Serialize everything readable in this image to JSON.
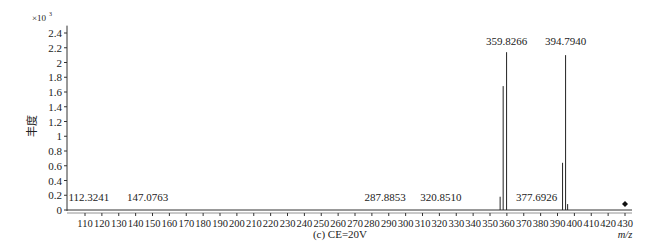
{
  "chart_data": {
    "type": "bar",
    "subtype": "mass-spectrum-stick",
    "title": "(c) CE=20V",
    "xlabel": "m/z",
    "ylabel": "丰度",
    "y_multiplier": "×10³",
    "xlim": [
      100,
      435
    ],
    "ylim": [
      0,
      2.5
    ],
    "x_ticks": [
      110,
      120,
      130,
      140,
      150,
      160,
      170,
      180,
      190,
      200,
      210,
      220,
      230,
      240,
      250,
      260,
      270,
      280,
      290,
      300,
      310,
      320,
      330,
      340,
      350,
      360,
      370,
      380,
      390,
      400,
      410,
      420,
      430
    ],
    "y_ticks": [
      0,
      0.2,
      0.4,
      0.6,
      0.8,
      1,
      1.2,
      1.4,
      1.6,
      1.8,
      2,
      2.2,
      2.4
    ],
    "y_tick_labels": [
      "0",
      "0.2",
      "0.4",
      "0.6",
      "0.8",
      "1",
      "1.2",
      "1.4",
      "1.6",
      "1.8",
      "2",
      "2.2",
      "2.4"
    ],
    "peaks": [
      {
        "mz": 112.3241,
        "intensity": 0.0
      },
      {
        "mz": 147.0763,
        "intensity": 0.0
      },
      {
        "mz": 287.8853,
        "intensity": 0.0
      },
      {
        "mz": 320.851,
        "intensity": 0.0
      },
      {
        "mz": 356.0,
        "intensity": 0.18
      },
      {
        "mz": 357.8,
        "intensity": 1.68
      },
      {
        "mz": 359.8266,
        "intensity": 2.14
      },
      {
        "mz": 377.6926,
        "intensity": 0.0
      },
      {
        "mz": 393.0,
        "intensity": 0.64
      },
      {
        "mz": 394.794,
        "intensity": 2.1
      },
      {
        "mz": 396.0,
        "intensity": 0.08
      }
    ],
    "annotations": [
      {
        "text": "112.3241",
        "x": 112.3241,
        "y": 0.2
      },
      {
        "text": "147.0763",
        "x": 147.0763,
        "y": 0.2
      },
      {
        "text": "287.8853",
        "x": 287.8853,
        "y": 0.2
      },
      {
        "text": "320.8510",
        "x": 320.851,
        "y": 0.2
      },
      {
        "text": "377.6926",
        "x": 377.6926,
        "y": 0.2
      },
      {
        "text": "359.8266",
        "x": 359.8266,
        "y": 2.3
      },
      {
        "text": "394.7940",
        "x": 394.794,
        "y": 2.3
      }
    ],
    "marker": {
      "symbol": "diamond",
      "x": 430,
      "y": 0.08
    },
    "grid": false,
    "legend": false
  }
}
